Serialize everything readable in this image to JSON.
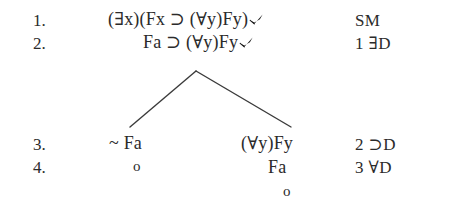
{
  "document": {
    "type": "logic-truth-tree",
    "background_color": "#ffffff",
    "ink_color": "#2b2b2b"
  },
  "columns": {
    "number_header": "",
    "formula_header": "",
    "justification_header": ""
  },
  "rows": [
    {
      "number": "1.",
      "formula_left": "(∃x)(Fx ⊃ (∀y)Fy)",
      "checked_left": true,
      "formula_right": "",
      "checked_right": false,
      "justification": "SM"
    },
    {
      "number": "2.",
      "formula_left": "Fa ⊃ (∀y)Fy",
      "checked_left": true,
      "formula_right": "",
      "checked_right": false,
      "justification": "1 ∃D"
    },
    {
      "number": "3.",
      "formula_left": "~ Fa",
      "checked_left": false,
      "formula_right": "(∀y)Fy",
      "checked_right": false,
      "justification": "2 ⊃D"
    },
    {
      "number": "4.",
      "formula_left": "o",
      "checked_left": false,
      "formula_right": "Fa",
      "checked_right": false,
      "justification": "3 ∀D"
    }
  ],
  "closure_marks": {
    "left_branch": "o",
    "right_branch": "o"
  },
  "branch": {
    "apex_label": "",
    "left_tip_label": "",
    "right_tip_label": ""
  },
  "symbols": {
    "exists": "∃",
    "forall": "∀",
    "horseshoe": "⊃",
    "negation": "~",
    "check": "✔",
    "open_circle": "o"
  }
}
